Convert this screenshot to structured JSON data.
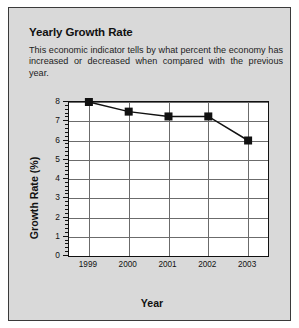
{
  "card": {
    "title": "Yearly Growth Rate",
    "description_line1": "This economic indicator tells by what percent the economy has",
    "description_line2": "increased or decreased when compared with the previous year.",
    "background_color": "#d9d9d9",
    "border_color": "#3a3a3a"
  },
  "chart_data": {
    "type": "line",
    "title": "Yearly Growth Rate",
    "categories": [
      "1999",
      "2000",
      "2001",
      "2002",
      "2003"
    ],
    "values": [
      8.0,
      7.5,
      7.25,
      7.25,
      6.0
    ],
    "xlabel": "Year",
    "ylabel": "Growth Rate (%)",
    "ylim": [
      0,
      8
    ],
    "ytick_labels": [
      "0",
      "1",
      "2",
      "3",
      "4",
      "5",
      "6",
      "7",
      "8"
    ],
    "ytick_values": [
      0,
      1,
      2,
      3,
      4,
      5,
      6,
      7,
      8
    ],
    "minor_ticks_per_interval": 4,
    "grid": "horizontal-and-vertical",
    "legend": "none",
    "marker": "square",
    "marker_color": "#111111",
    "line_color": "#111111",
    "plot_background": "#ffffff"
  }
}
